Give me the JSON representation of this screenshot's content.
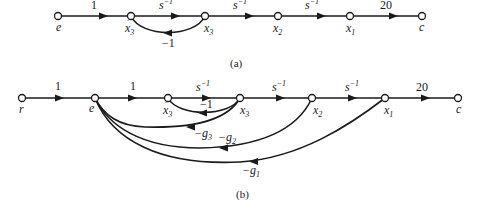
{
  "diagram_a": {
    "caption": "(a)",
    "nodes": [
      {
        "id": "e",
        "label": "e"
      },
      {
        "id": "x3dot",
        "label": "x",
        "dot": true,
        "sub": "3"
      },
      {
        "id": "x3",
        "label": "x",
        "sub": "3"
      },
      {
        "id": "x2",
        "label": "x",
        "sub": "2"
      },
      {
        "id": "x1",
        "label": "x",
        "sub": "1"
      },
      {
        "id": "c",
        "label": "c"
      }
    ],
    "branches": [
      {
        "from": "e",
        "to": "x3dot",
        "gain": "1"
      },
      {
        "from": "x3dot",
        "to": "x3",
        "gain_base": "s",
        "gain_sup": "−1"
      },
      {
        "from": "x3",
        "to": "x2",
        "gain_base": "s",
        "gain_sup": "−1"
      },
      {
        "from": "x2",
        "to": "x1",
        "gain_base": "s",
        "gain_sup": "−1"
      },
      {
        "from": "x1",
        "to": "c",
        "gain": "20"
      },
      {
        "from": "x3",
        "to": "x3dot",
        "gain": "−1",
        "feedback": true
      }
    ]
  },
  "diagram_b": {
    "caption": "(b)",
    "nodes": [
      {
        "id": "r",
        "label": "r"
      },
      {
        "id": "e",
        "label": "e"
      },
      {
        "id": "x3dot",
        "label": "x",
        "dot": true,
        "sub": "3"
      },
      {
        "id": "x3",
        "label": "x",
        "sub": "3"
      },
      {
        "id": "x2",
        "label": "x",
        "sub": "2"
      },
      {
        "id": "x1",
        "label": "x",
        "sub": "1"
      },
      {
        "id": "c",
        "label": "c"
      }
    ],
    "branches": [
      {
        "from": "r",
        "to": "e",
        "gain": "1"
      },
      {
        "from": "e",
        "to": "x3dot",
        "gain": "1"
      },
      {
        "from": "x3dot",
        "to": "x3",
        "gain_base": "s",
        "gain_sup": "−1"
      },
      {
        "from": "x3",
        "to": "x2",
        "gain_base": "s",
        "gain_sup": "−1"
      },
      {
        "from": "x2",
        "to": "x1",
        "gain_base": "s",
        "gain_sup": "−1"
      },
      {
        "from": "x1",
        "to": "c",
        "gain": "20"
      },
      {
        "from": "x3",
        "to": "x3dot",
        "gain": "−1",
        "feedback": true
      },
      {
        "from": "x3",
        "to": "e",
        "gain_base": "−g",
        "gain_sub": "3",
        "feedback": true
      },
      {
        "from": "x2",
        "to": "e",
        "gain_base": "−g",
        "gain_sub": "2",
        "feedback": true
      },
      {
        "from": "x1",
        "to": "e",
        "gain_base": "−g",
        "gain_sub": "1",
        "feedback": true
      }
    ]
  }
}
